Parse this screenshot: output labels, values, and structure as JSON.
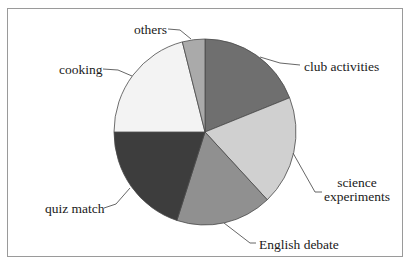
{
  "chart_data": {
    "type": "pie",
    "title": "",
    "start_angle_deg": 0,
    "direction": "clockwise",
    "categories": [
      "club activities",
      "science experiments",
      "English debate",
      "quiz match",
      "cooking",
      "others"
    ],
    "values": [
      19,
      19,
      17,
      20,
      21,
      4
    ],
    "unit": "percent (estimated from slice angles)",
    "colors": [
      "#6f6f6f",
      "#d0d0d0",
      "#909090",
      "#3d3d3d",
      "#f3f3f3",
      "#aaaaaa"
    ],
    "legend": "none (leader-line labels)"
  },
  "labels": {
    "club": "club activities",
    "science_line1": "science",
    "science_line2": "experiments",
    "english": "English debate",
    "quiz": "quiz match",
    "cooking": "cooking",
    "others": "others"
  }
}
